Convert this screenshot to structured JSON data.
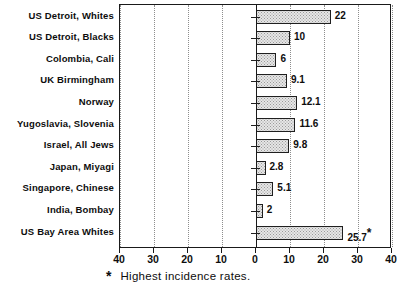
{
  "chart_data": {
    "type": "bar",
    "orientation": "horizontal",
    "title": "",
    "subtitle": "",
    "xlabel": "",
    "ylabel": "",
    "xlim": [
      -40,
      40
    ],
    "xticks": [
      -40,
      -30,
      -20,
      -10,
      0,
      10,
      20,
      30,
      40
    ],
    "xticklabels": [
      "40",
      "30",
      "20",
      "10",
      "0",
      "10",
      "20",
      "30",
      "40"
    ],
    "grid": true,
    "grid_axis": "x",
    "legend": false,
    "categories": [
      "US Detroit, Whites",
      "US Detroit, Blacks",
      "Colombia, Cali",
      "UK Birmingham",
      "Norway",
      "Yugoslavia, Slovenia",
      "Israel, All Jews",
      "Japan, Miyagi",
      "Singapore, Chinese",
      "India, Bombay",
      "US Bay Area Whites"
    ],
    "values": [
      22,
      10,
      6,
      9.1,
      12.1,
      11.6,
      9.8,
      2.8,
      5.1,
      2,
      25.7
    ],
    "value_labels": [
      "22",
      "10",
      "6",
      "9.1",
      "12.1",
      "11.6",
      "9.8",
      "2.8",
      "5.1",
      "2",
      "25.7"
    ],
    "annotations": [
      {
        "category": "US Bay Area Whites",
        "marker": "*",
        "note": "Highest incidence rates."
      }
    ],
    "bar_fill": "#e6e6e6",
    "bar_edge": "#1f1f1f",
    "axis_color": "#1a1a1a",
    "grid_color": "#8d8d8d"
  },
  "footnote": {
    "star": "*",
    "text": "Highest incidence rates."
  }
}
